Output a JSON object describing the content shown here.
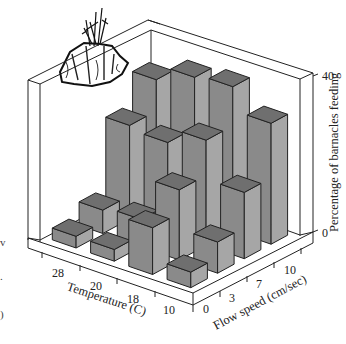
{
  "chart_data": {
    "type": "bar3d",
    "title": "",
    "zlabel": "Percentage of barnacles feeding",
    "zlim": [
      0,
      40
    ],
    "z_ticks": [
      "0",
      "40"
    ],
    "x_axis": {
      "label": "Temperature (C)",
      "categories": [
        "28",
        "20",
        "18",
        "10"
      ]
    },
    "y_axis": {
      "label": "Flow speed (cm/sec)",
      "categories": [
        "0",
        "3",
        "7",
        "10"
      ]
    },
    "series": [
      {
        "name": "28",
        "values": [
          3,
          6,
          24,
          32
        ]
      },
      {
        "name": "20",
        "values": [
          3,
          7,
          23,
          36
        ]
      },
      {
        "name": "18",
        "values": [
          12,
          18,
          27,
          37
        ]
      },
      {
        "name": "10",
        "values": [
          4,
          8,
          17,
          31
        ]
      }
    ],
    "grid": false,
    "legend": "none",
    "illustration": "barnacle-on-rock"
  },
  "labels": {
    "z_axis_title": "Percentage of barnacles feeding",
    "z_max": "40",
    "z_min": "0",
    "temp_title": "Temperature (C)",
    "flow_title": "Flow speed (cm/sec)"
  },
  "colors": {
    "bar_front": "#8a8a8a",
    "bar_side": "#a6a6a6",
    "bar_top": "#6f6f6f",
    "line": "#222222"
  }
}
